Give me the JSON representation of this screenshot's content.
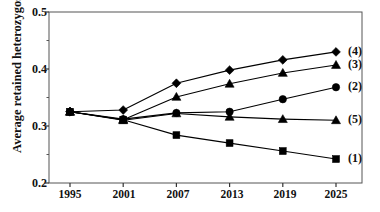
{
  "chart_data": {
    "type": "line",
    "title": "",
    "xlabel": "",
    "ylabel": "Average retained heterozygosity",
    "categories": [
      1995,
      2001,
      2007,
      2013,
      2019,
      2025
    ],
    "xticklabels": [
      "1995",
      "2001",
      "2007",
      "2013",
      "2019",
      "2025"
    ],
    "yticklabels": [
      "0.2",
      "0.3",
      "0.4",
      "0.5"
    ],
    "ytickvalues": [
      0.2,
      0.3,
      0.4,
      0.5
    ],
    "yminorticks": [
      0.25,
      0.35,
      0.45
    ],
    "xlim": [
      1992,
      2028
    ],
    "ylim": [
      0.2,
      0.5
    ],
    "grid": false,
    "legend_position": "right-inline",
    "series": [
      {
        "name": "(1)",
        "marker": "square",
        "values": [
          0.325,
          0.311,
          0.284,
          0.27,
          0.256,
          0.242
        ]
      },
      {
        "name": "(2)",
        "marker": "circle",
        "values": [
          0.325,
          0.312,
          0.323,
          0.325,
          0.347,
          0.368
        ]
      },
      {
        "name": "(3)",
        "marker": "triangle",
        "values": [
          0.325,
          0.311,
          0.351,
          0.374,
          0.393,
          0.407
        ]
      },
      {
        "name": "(4)",
        "marker": "diamond",
        "values": [
          0.325,
          0.328,
          0.375,
          0.398,
          0.416,
          0.43
        ]
      },
      {
        "name": "(5)",
        "marker": "triangle",
        "values": [
          0.325,
          0.31,
          0.322,
          0.316,
          0.312,
          0.31
        ]
      }
    ]
  },
  "colors": {
    "line": "#000000",
    "marker": "#000000",
    "axis": "#555555",
    "text": "#111111",
    "background": "#ffffff"
  }
}
